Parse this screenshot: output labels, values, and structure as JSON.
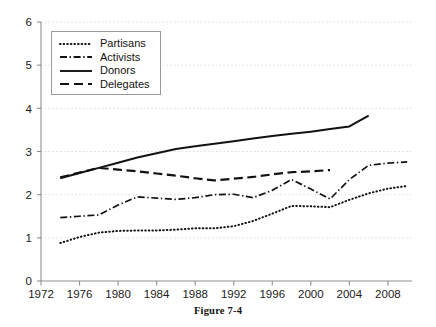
{
  "caption": "Figure 7-4",
  "legend": {
    "position": "upper-left-inside",
    "entries": [
      {
        "label": "Partisans",
        "style": "dotted",
        "icon": "line-dotted-icon"
      },
      {
        "label": "Activists",
        "style": "dashdot",
        "icon": "line-dashdot-icon"
      },
      {
        "label": "Donors",
        "style": "solid",
        "icon": "line-solid-icon"
      },
      {
        "label": "Delegates",
        "style": "dashed",
        "icon": "line-dashed-icon"
      }
    ]
  },
  "colors": {
    "ink": "#14120f",
    "axis": "#8f8f8f",
    "grid": "#d9d6d2",
    "background": "#ffffff"
  },
  "chart_data": {
    "type": "line",
    "title": "",
    "xlabel": "",
    "ylabel": "",
    "xlim": [
      1972,
      2010.5
    ],
    "ylim": [
      0,
      6
    ],
    "grid": true,
    "xticks": [
      1972,
      1976,
      1980,
      1984,
      1988,
      1992,
      1996,
      2000,
      2004,
      2008
    ],
    "xtick_labels": [
      "1972",
      "1976",
      "1980",
      "1984",
      "1988",
      "1992",
      "1996",
      "2000",
      "2004",
      "2008"
    ],
    "yticks": [
      0,
      1,
      2,
      3,
      4,
      5,
      6
    ],
    "ytick_labels": [
      "0",
      "1",
      "2",
      "3",
      "4",
      "5",
      "6"
    ],
    "legend_position": "upper left",
    "series": [
      {
        "name": "Partisans",
        "style": "dotted",
        "x": [
          1974,
          1976,
          1978,
          1980,
          1982,
          1984,
          1986,
          1988,
          1990,
          1992,
          1994,
          1996,
          1998,
          2000,
          2002,
          2004,
          2006,
          2008,
          2010
        ],
        "values": [
          0.88,
          1.02,
          1.12,
          1.16,
          1.17,
          1.17,
          1.19,
          1.22,
          1.22,
          1.27,
          1.39,
          1.56,
          1.74,
          1.73,
          1.71,
          1.88,
          2.03,
          2.14,
          2.2
        ]
      },
      {
        "name": "Activists",
        "style": "dashdot",
        "x": [
          1974,
          1976,
          1978,
          1980,
          1982,
          1984,
          1986,
          1988,
          1990,
          1992,
          1994,
          1996,
          1998,
          2000,
          2002,
          2004,
          2006,
          2008,
          2010
        ],
        "values": [
          1.47,
          1.5,
          1.53,
          1.76,
          1.95,
          1.92,
          1.89,
          1.93,
          2.0,
          2.01,
          1.93,
          2.1,
          2.35,
          2.13,
          1.9,
          2.35,
          2.68,
          2.73,
          2.76
        ]
      },
      {
        "name": "Donors",
        "style": "solid",
        "x": [
          1974,
          1976,
          1978,
          1980,
          1982,
          1984,
          1986,
          1988,
          1990,
          1992,
          1994,
          1996,
          1998,
          2000,
          2002,
          2004,
          2006
        ],
        "values": [
          2.38,
          2.5,
          2.62,
          2.74,
          2.86,
          2.96,
          3.06,
          3.12,
          3.18,
          3.24,
          3.3,
          3.36,
          3.41,
          3.46,
          3.52,
          3.58,
          3.83
        ]
      },
      {
        "name": "Delegates",
        "style": "dashed",
        "x": [
          1974,
          1976,
          1978,
          1980,
          1982,
          1984,
          1986,
          1988,
          1990,
          1992,
          1994,
          1996,
          1998,
          2000,
          2002
        ],
        "values": [
          2.4,
          2.51,
          2.62,
          2.58,
          2.54,
          2.49,
          2.44,
          2.38,
          2.33,
          2.37,
          2.41,
          2.47,
          2.52,
          2.54,
          2.57
        ]
      }
    ]
  }
}
